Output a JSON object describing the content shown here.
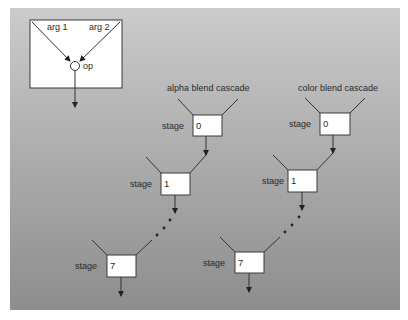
{
  "legend": {
    "arg1_label": "arg 1",
    "arg2_label": "arg 2",
    "op_label": "op"
  },
  "cascades": [
    {
      "title": "alpha blend cascade",
      "stage_label": "stage",
      "stages": [
        "0",
        "1",
        "7"
      ]
    },
    {
      "title": "color blend cascade",
      "stage_label": "stage",
      "stages": [
        "0",
        "1",
        "7"
      ]
    }
  ],
  "colors": {
    "panel_top": "#c9c9c9",
    "panel_bottom": "#8e8e8e",
    "box_fill": "#ffffff",
    "line": "#333333"
  }
}
